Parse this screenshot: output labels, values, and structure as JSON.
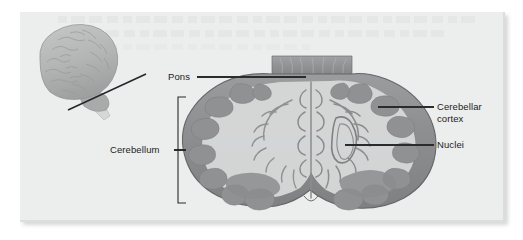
{
  "figure": {
    "type": "anatomical-diagram",
    "panel_background": "#eceded",
    "page_background": "#ffffff",
    "label_color": "#1c1c1c",
    "leader_line_color": "#2b2b2b",
    "bracket_color": "#2b2b2b"
  },
  "labels": {
    "pons": "Pons",
    "cerebellum": "Cerebellum",
    "cerebellar_cortex": "Cerebellar\ncortex",
    "cerebellar_cortex_line1": "Cerebellar",
    "cerebellar_cortex_line2": "cortex",
    "nuclei": "Nuclei"
  },
  "inset": {
    "name": "lateral-brain-inset",
    "description": "Lateral view of whole brain with section plane line through cerebellum",
    "cortex_fill": "#b9bbbb",
    "cerebellum_fill": "#a8aaaa",
    "brainstem_fill": "#d2d4d4",
    "section_line_color": "#23272b"
  },
  "cross_section": {
    "name": "cerebellum-coronal-section",
    "outer_cortex_fill": "#8e9091",
    "folia_fill": "#9b9d9d",
    "white_matter_fill": "#d5d7d7",
    "pons_fill": "#86888a",
    "outline_color": "#6f7172"
  },
  "bracket": {
    "name": "cerebellum-extent-bracket",
    "top_y": 97,
    "bottom_y": 203
  },
  "bleed_through": {
    "description": "Faint ghost text showing through from reverse side of page",
    "legible": false
  }
}
